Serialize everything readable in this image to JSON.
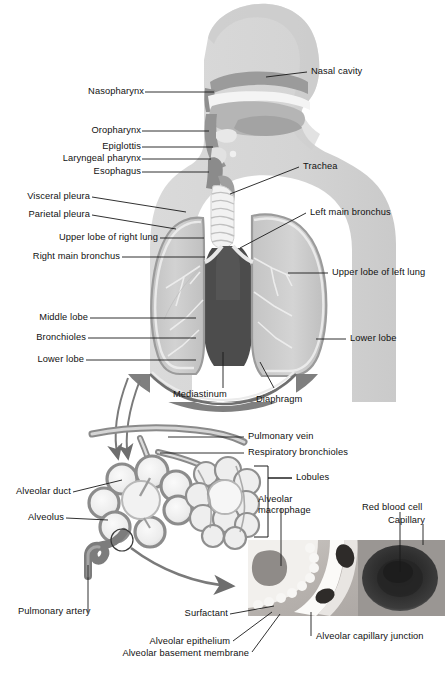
{
  "figure": {
    "type": "anatomical-illustration",
    "palette": {
      "body_silhouette": "#d6d6d6",
      "head_shadow": "#c4c4c4",
      "airway_dark": "#8e8e8e",
      "nasal_cavity": "#9a9a9a",
      "lung_fill": "#c9c9c9",
      "lung_light": "#dcdcdc",
      "pleura_outline": "#a0a0a0",
      "mediastinum": "#4c4c4c",
      "diaphragm": "#8a8a8a",
      "vessel_gray": "#7d7d7d",
      "alveoli_fill": "#efefef",
      "alveoli_outline": "#8a8a8a",
      "leader_line": "#1a1a1a",
      "inset_bg": "#b9b4b0",
      "rbc_dark": "#2c2c2c",
      "background": "#ffffff"
    }
  },
  "labels": {
    "left_column": [
      {
        "id": "nasopharynx",
        "text": "Nasopharynx"
      },
      {
        "id": "oropharynx",
        "text": "Oropharynx"
      },
      {
        "id": "epiglottis",
        "text": "Epiglottis"
      },
      {
        "id": "laryngeal-pharynx",
        "text": "Laryngeal pharynx"
      },
      {
        "id": "esophagus",
        "text": "Esophagus"
      },
      {
        "id": "visceral-pleura",
        "text": "Visceral pleura"
      },
      {
        "id": "parietal-pleura",
        "text": "Parietal pleura"
      },
      {
        "id": "upper-lobe-right",
        "text": "Upper lobe of right lung"
      },
      {
        "id": "right-main-bronchus",
        "text": "Right main bronchus"
      },
      {
        "id": "middle-lobe",
        "text": "Middle lobe"
      },
      {
        "id": "bronchioles",
        "text": "Bronchioles"
      },
      {
        "id": "lower-lobe-right",
        "text": "Lower lobe"
      },
      {
        "id": "alveolar-duct",
        "text": "Alveolar duct"
      },
      {
        "id": "alveolus",
        "text": "Alveolus"
      },
      {
        "id": "pulmonary-artery",
        "text": "Pulmonary artery"
      }
    ],
    "right_column": [
      {
        "id": "nasal-cavity",
        "text": "Nasal cavity"
      },
      {
        "id": "trachea",
        "text": "Trachea"
      },
      {
        "id": "left-main-bronchus",
        "text": "Left main bronchus"
      },
      {
        "id": "upper-lobe-left",
        "text": "Upper lobe of left lung"
      },
      {
        "id": "lower-lobe-left",
        "text": "Lower lobe"
      },
      {
        "id": "pulmonary-vein",
        "text": "Pulmonary vein"
      },
      {
        "id": "respiratory-bronchioles",
        "text": "Respiratory bronchioles"
      },
      {
        "id": "lobules",
        "text": "Lobules"
      },
      {
        "id": "alveolar-macrophage",
        "text": "Alveolar\nmacrophage"
      },
      {
        "id": "red-blood-cell",
        "text": "Red blood cell"
      },
      {
        "id": "capillary",
        "text": "Capillary"
      }
    ],
    "center_bottom": [
      {
        "id": "mediastinum",
        "text": "Mediastinum"
      },
      {
        "id": "diaphragm",
        "text": "Diaphragm"
      }
    ],
    "inset_callouts": [
      {
        "id": "surfactant",
        "text": "Surfactant"
      },
      {
        "id": "alveolar-epithelium",
        "text": "Alveolar epithelium"
      },
      {
        "id": "alveolar-basement-membrane",
        "text": "Alveolar basement membrane"
      },
      {
        "id": "alveolar-capillary-junction",
        "text": "Alveolar capillary junction"
      }
    ],
    "macrophage_line1": "Alveolar",
    "macrophage_line2": "macrophage"
  }
}
